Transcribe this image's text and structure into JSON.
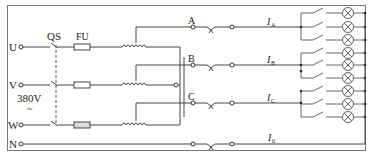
{
  "diagram": {
    "type": "three-phase four-wire lighting circuit",
    "inputs": [
      {
        "id": "U",
        "label": "U",
        "y": 47
      },
      {
        "id": "V",
        "label": "V",
        "y": 85
      },
      {
        "id": "W",
        "label": "W",
        "y": 125
      },
      {
        "id": "N",
        "label": "N",
        "y": 144
      }
    ],
    "supply_voltage": {
      "value": "380V",
      "symbol": "~"
    },
    "components": {
      "switch_label": "QS",
      "fuse_label": "FU"
    },
    "outputs": [
      {
        "id": "A",
        "label": "A",
        "current_label": "I",
        "current_sub": "A",
        "y": 27,
        "lamps": 3
      },
      {
        "id": "B",
        "label": "B",
        "current_label": "I",
        "current_sub": "B",
        "y": 65,
        "lamps": 3
      },
      {
        "id": "C",
        "label": "C",
        "current_label": "I",
        "current_sub": "C",
        "y": 103,
        "lamps": 3
      },
      {
        "id": "N",
        "label": "",
        "current_label": "I",
        "current_sub": "0",
        "y": 144,
        "lamps": 0
      }
    ],
    "colors": {
      "line": "#444444",
      "border": "#777777",
      "background": "#ffffff"
    }
  }
}
